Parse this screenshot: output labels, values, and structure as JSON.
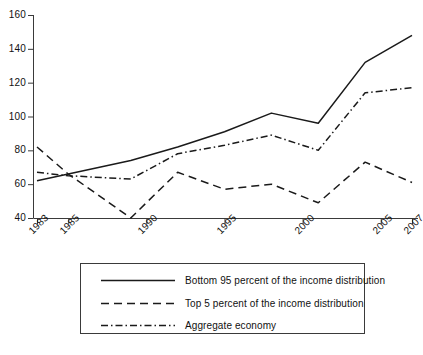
{
  "chart_data": {
    "type": "line",
    "title": "",
    "xlabel": "",
    "ylabel": "",
    "xlim": [
      1983,
      2007
    ],
    "ylim": [
      40,
      160
    ],
    "grid": false,
    "legend_position": "bottom",
    "xticks": [
      "1983",
      "1985",
      "1990",
      "1995",
      "2000",
      "2005",
      "2007"
    ],
    "xtick_values": [
      1983,
      1985,
      1990,
      1995,
      2000,
      2005,
      2007
    ],
    "yticks": [
      "40",
      "60",
      "80",
      "100",
      "120",
      "140",
      "160"
    ],
    "ytick_values": [
      40,
      60,
      80,
      100,
      120,
      140,
      160
    ],
    "series": [
      {
        "name": "Bottom 95 percent of the income distribution",
        "style": "solid",
        "color": "#1a1a1a",
        "x": [
          1983,
          1985,
          1989,
          1992,
          1995,
          1998,
          2001,
          2004,
          2007
        ],
        "values": [
          62,
          66,
          74,
          82,
          91,
          102,
          96,
          132,
          148
        ]
      },
      {
        "name": "Top 5 percent of the income distribution",
        "style": "dashed",
        "color": "#1a1a1a",
        "x": [
          1983,
          1985,
          1989,
          1992,
          1995,
          1998,
          2001,
          2004,
          2007
        ],
        "values": [
          82,
          66,
          40,
          67,
          57,
          60,
          49,
          73,
          61
        ]
      },
      {
        "name": "Aggregate economy",
        "style": "dashdot",
        "color": "#1a1a1a",
        "x": [
          1983,
          1985,
          1989,
          1992,
          1995,
          1998,
          2001,
          2004,
          2007
        ],
        "values": [
          67,
          65,
          63,
          78,
          83,
          89,
          80,
          114,
          117
        ]
      }
    ]
  },
  "legend": {
    "items": [
      {
        "label": "Bottom 95 percent of the income distribution",
        "style": "solid"
      },
      {
        "label": "Top 5 percent of the income distribution",
        "style": "dashed"
      },
      {
        "label": "Aggregate economy",
        "style": "dashdot"
      }
    ]
  }
}
